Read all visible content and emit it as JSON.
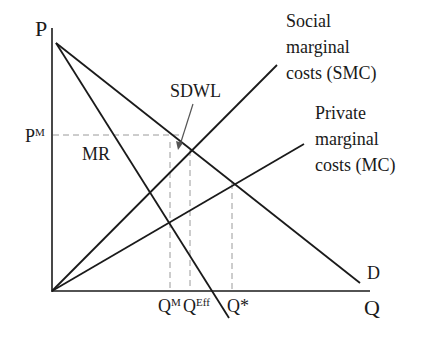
{
  "diagram": {
    "axes": {
      "y_label": "P",
      "x_label": "Q"
    },
    "curves": {
      "demand": "D",
      "marginal_revenue": "MR",
      "social_marginal_cost": [
        "Social",
        "marginal",
        "costs (SMC)"
      ],
      "private_marginal_cost": [
        "Private",
        "marginal",
        "costs (MC)"
      ]
    },
    "price_labels": {
      "monopoly_price_base": "P",
      "monopoly_price_sup": "M"
    },
    "quantity_labels": {
      "q_monopoly_base": "Q",
      "q_monopoly_sup": "M",
      "q_efficient_base": "Q",
      "q_efficient_sup": "Eff",
      "q_star": "Q*"
    },
    "annotations": {
      "sdwl": "SDWL"
    },
    "colors": {
      "line": "#1a1a1a",
      "dashed": "#9a9a9a",
      "arrow": "#555555",
      "background": "#ffffff"
    }
  }
}
